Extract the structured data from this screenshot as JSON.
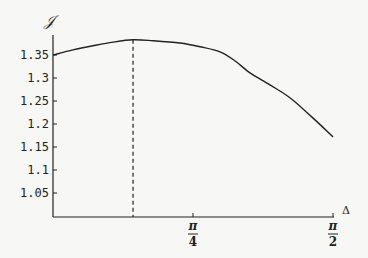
{
  "chart_data": {
    "type": "line",
    "title": "",
    "xlabel": "Δ",
    "ylabel": "𝒥",
    "x_tick_labels": [
      {
        "value": 0.7854,
        "num": "π",
        "den": "4"
      },
      {
        "value": 1.5708,
        "num": "π",
        "den": "2"
      }
    ],
    "y_ticks": [
      1.05,
      1.1,
      1.15,
      1.2,
      1.25,
      1.3,
      1.35
    ],
    "y_tick_labels": [
      "1.05",
      "1.1",
      "1.15",
      "1.2",
      "1.25",
      "1.3",
      "1.35"
    ],
    "xlim": [
      0,
      1.5708
    ],
    "ylim": [
      1.0,
      1.39
    ],
    "grid": false,
    "legend": null,
    "series": [
      {
        "name": "J(Δ)",
        "style": "solid",
        "x": [
          0,
          0.112,
          0.224,
          0.337,
          0.449,
          0.561,
          0.712,
          0.825,
          0.937,
          1.022,
          1.105,
          1.217,
          1.329,
          1.45,
          1.571
        ],
        "y": [
          1.35,
          1.361,
          1.37,
          1.378,
          1.383,
          1.381,
          1.376,
          1.368,
          1.357,
          1.337,
          1.311,
          1.285,
          1.257,
          1.216,
          1.172
        ]
      }
    ],
    "annotations": [
      {
        "type": "vertical-dashed-line",
        "x": 0.449,
        "from_y": 1.0,
        "to_y": 1.383,
        "note": "location of maximum"
      }
    ]
  }
}
